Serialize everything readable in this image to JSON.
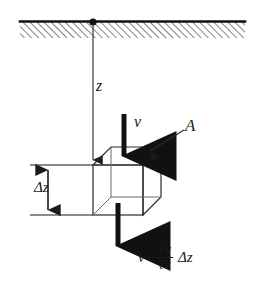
{
  "figure": {
    "background_color": "#ffffff",
    "line_color": "#1a1a1a",
    "hatch_color": "#555555",
    "width": 262,
    "height": 288
  },
  "labels": {
    "depth_coordinate": "z",
    "velocity_in": "v",
    "area": "A",
    "thickness": "Δz"
  },
  "equation": {
    "first_term": "v",
    "operator": "+",
    "numerator": "∂v",
    "denominator": "∂z",
    "tail": "Δz",
    "full_text": "v + ∂v/∂z Δz"
  },
  "geometry": {
    "ceiling_hatch_band": {
      "x": 20,
      "y": 21,
      "width": 225,
      "height": 17
    },
    "anchor_dot": {
      "cx": 93,
      "cy": 22,
      "r": 3.6
    },
    "z_line": {
      "x": 93,
      "y_top": 22,
      "y_bottom": 166
    },
    "cube_front_face": {
      "x": 93,
      "y": 165,
      "width": 50,
      "height": 50
    },
    "cube_depth_offset": {
      "dx": 18,
      "dy": -18
    },
    "inflow_arrow": {
      "x": 124,
      "y_top": 114,
      "y_bottom": 161
    },
    "outflow_arrow": {
      "x": 118,
      "y_top": 203,
      "y_bottom": 251
    },
    "dimension_line": {
      "x": 48,
      "y_top": 165,
      "y_bottom": 215
    },
    "dimension_tick_top": {
      "x1": 30,
      "x2": 93,
      "y": 165
    },
    "dimension_tick_bottom": {
      "x1": 30,
      "x2": 93,
      "y": 215
    },
    "area_leader_line": {
      "x1": 182,
      "y1": 131,
      "x2": 147,
      "y2": 153
    }
  }
}
